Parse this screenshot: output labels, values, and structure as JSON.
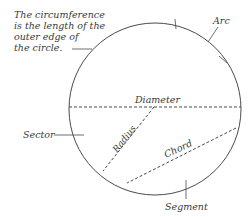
{
  "diagram": {
    "note": {
      "lines": [
        "The circumference",
        "is the length of the",
        "outer edge of",
        "the circle."
      ]
    },
    "labels": {
      "arc": "Arc",
      "diameter": "Diameter",
      "radius": "Radius",
      "chord": "Chord",
      "sector": "Sector",
      "segment": "Segment"
    },
    "colors": {
      "stroke": "#4a4a4a",
      "text": "#3a3a3a",
      "background": "#ffffff"
    }
  }
}
